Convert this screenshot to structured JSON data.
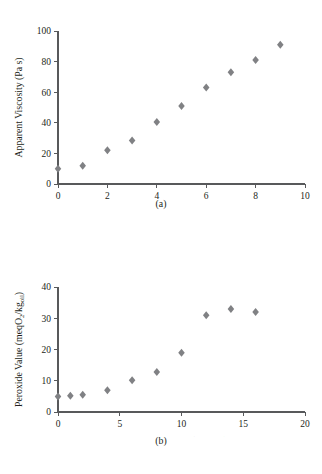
{
  "figure": {
    "panels": [
      {
        "id": "a",
        "caption": "(a)",
        "xlabel": "Storage Time (months)",
        "ylabel": "Apparent Viscosity (Pa s)",
        "ylabel_parts": {
          "main": "Apparent Viscosity (Pa s)"
        },
        "xticks": [
          "0",
          "2",
          "4",
          "6",
          "8",
          "10"
        ],
        "yticks": [
          "0",
          "20",
          "40",
          "60",
          "80",
          "100"
        ]
      },
      {
        "id": "b",
        "caption": "(b)",
        "xlabel": "Storage Time (months)",
        "ylabel": "Peroxide Value (meqO2/kgoil)",
        "ylabel_parts": {
          "p1": "Peroxide Value (meqO",
          "sub1": "2",
          "p2": "/kg",
          "sub2": "oil",
          "p3": ")"
        },
        "xticks": [
          "0",
          "5",
          "10",
          "15",
          "20"
        ],
        "yticks": [
          "0",
          "10",
          "20",
          "30",
          "40"
        ]
      }
    ]
  },
  "chart_data": [
    {
      "type": "scatter",
      "title": "(a)",
      "xlabel": "Storage Time (months)",
      "ylabel": "Apparent Viscosity (Pa s)",
      "xlim": [
        0,
        10
      ],
      "ylim": [
        0,
        100
      ],
      "xticks": [
        0,
        2,
        4,
        6,
        8,
        10
      ],
      "yticks": [
        0,
        20,
        40,
        60,
        80,
        100
      ],
      "grid": false,
      "legend": "none",
      "marker": "diamond",
      "marker_color": "#808184",
      "x": [
        0,
        1,
        2,
        3,
        4,
        5,
        6,
        7,
        8,
        9
      ],
      "y": [
        10,
        12,
        22,
        28.5,
        40.5,
        51,
        63,
        73,
        81,
        91
      ]
    },
    {
      "type": "scatter",
      "title": "(b)",
      "xlabel": "Storage Time (months)",
      "ylabel": "Peroxide Value (meqO2/kgoil)",
      "xlim": [
        0,
        20
      ],
      "ylim": [
        0,
        40
      ],
      "xticks": [
        0,
        5,
        10,
        15,
        20
      ],
      "yticks": [
        0,
        10,
        20,
        30,
        40
      ],
      "grid": false,
      "legend": "none",
      "marker": "diamond",
      "marker_color": "#808184",
      "x": [
        0,
        1,
        2,
        4,
        6,
        8,
        10,
        12,
        14,
        16
      ],
      "y": [
        5,
        5.2,
        5.5,
        7,
        10.2,
        12.8,
        19,
        31,
        33,
        32
      ]
    }
  ]
}
